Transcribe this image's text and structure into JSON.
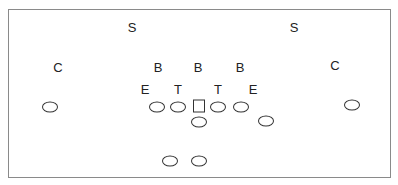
{
  "diagram": {
    "type": "football-formation",
    "border_color": "#8a8a8a",
    "stroke_color": "#333333",
    "defense": [
      {
        "label": "S",
        "role": "safety",
        "x": 132,
        "y": 28
      },
      {
        "label": "S",
        "role": "safety",
        "x": 294,
        "y": 28
      },
      {
        "label": "C",
        "role": "cornerback",
        "x": 58,
        "y": 68
      },
      {
        "label": "C",
        "role": "cornerback",
        "x": 335,
        "y": 66
      },
      {
        "label": "B",
        "role": "linebacker",
        "x": 158,
        "y": 68
      },
      {
        "label": "B",
        "role": "linebacker",
        "x": 198,
        "y": 68
      },
      {
        "label": "B",
        "role": "linebacker",
        "x": 240,
        "y": 68
      },
      {
        "label": "E",
        "role": "end",
        "x": 145,
        "y": 90
      },
      {
        "label": "T",
        "role": "tackle",
        "x": 178,
        "y": 90
      },
      {
        "label": "T",
        "role": "tackle",
        "x": 218,
        "y": 90
      },
      {
        "label": "E",
        "role": "end",
        "x": 253,
        "y": 90
      }
    ],
    "offense": {
      "center": {
        "shape": "square",
        "x": 199,
        "y": 106
      },
      "players": [
        {
          "shape": "oval",
          "role": "wide-receiver",
          "x": 50,
          "y": 107
        },
        {
          "shape": "oval",
          "role": "guard",
          "x": 157,
          "y": 107
        },
        {
          "shape": "oval",
          "role": "guard",
          "x": 178,
          "y": 107
        },
        {
          "shape": "oval",
          "role": "tackle",
          "x": 218,
          "y": 107
        },
        {
          "shape": "oval",
          "role": "tackle",
          "x": 241,
          "y": 107
        },
        {
          "shape": "oval",
          "role": "wide-receiver",
          "x": 352,
          "y": 105
        },
        {
          "shape": "oval",
          "role": "quarterback",
          "x": 199,
          "y": 122
        },
        {
          "shape": "oval",
          "role": "wing",
          "x": 266,
          "y": 121
        },
        {
          "shape": "oval",
          "role": "running-back",
          "x": 170,
          "y": 161
        },
        {
          "shape": "oval",
          "role": "running-back",
          "x": 199,
          "y": 161
        }
      ]
    }
  }
}
